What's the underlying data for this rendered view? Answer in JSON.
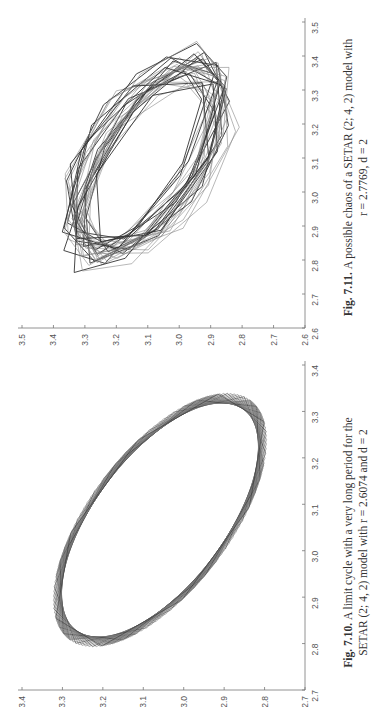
{
  "figures": [
    {
      "id": "fig-7-11",
      "caption": {
        "label": "Fig. 7.11.",
        "line1": "A possible chaos of a SETAR (2; 4, 2) model with",
        "line2": "r = 2.7769, d = 2"
      }
    },
    {
      "id": "fig-7-10",
      "caption": {
        "label": "Fig. 7.10.",
        "line1": "A limit cycle with a very long period for the",
        "line2": "SETAR (2; 4, 2) model with r = 2.6074 and d = 2"
      }
    }
  ],
  "chart_data": [
    {
      "type": "line",
      "title": "Fig. 7.11. A possible chaos of a SETAR (2; 4, 2) model with r = 2.7769, d = 2",
      "description": "Phase plot (x_t vs x_{t-1}) of a chaotic trajectory; many overlapping polygonal loops forming a tilted elliptical band",
      "xlabel": "",
      "ylabel": "",
      "xlim": [
        2.6,
        3.5
      ],
      "ylim": [
        2.6,
        3.5
      ],
      "xticks": [
        2.6,
        2.7,
        2.8,
        2.9,
        3.0,
        3.1,
        3.2,
        3.3,
        3.4,
        3.5
      ],
      "yticks": [
        2.6,
        2.7,
        2.8,
        2.9,
        3.0,
        3.1,
        3.2,
        3.3,
        3.4,
        3.5
      ],
      "grid": false
    },
    {
      "type": "line",
      "title": "Fig. 7.10. A limit cycle with a very long period for the SETAR (2; 4, 2) model with r = 2.6074 and d = 2",
      "description": "Phase plot of a long-period limit cycle; regularly shifted polygons forming a thin tilted elliptical ring",
      "xlabel": "",
      "ylabel": "",
      "xlim": [
        2.7,
        3.4
      ],
      "ylim": [
        2.7,
        3.4
      ],
      "xticks": [
        2.7,
        2.8,
        2.9,
        3.0,
        3.1,
        3.2,
        3.3,
        3.4
      ],
      "yticks": [
        2.7,
        2.8,
        2.9,
        3.0,
        3.1,
        3.2,
        3.3,
        3.4
      ],
      "grid": false
    }
  ]
}
